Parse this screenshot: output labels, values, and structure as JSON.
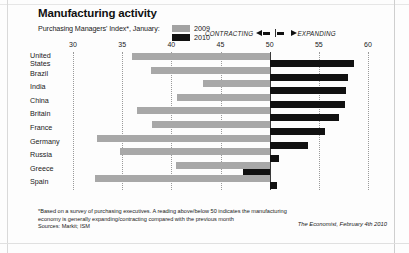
{
  "header": {
    "title": "Manufacturing activity",
    "subtitle": "Purchasing Managers' Index*, January:",
    "legend": [
      {
        "label": "2009",
        "color": "#a3a3a3"
      },
      {
        "label": "2010",
        "color": "#111111"
      }
    ],
    "banner": {
      "contracting": "CONTRACTING",
      "expanding": "EXPANDING"
    }
  },
  "footer": {
    "note_line1": "*Based on a survey of purchasing executives. A reading above/below 50 indicates the manufacturing",
    "note_line2": "economy is generally expanding/contracting compared with the previous month",
    "sources": "Sources: Markit; ISM",
    "credit": "The Economist, February 4th 2010"
  },
  "chart_data": {
    "type": "bar",
    "orientation": "horizontal",
    "title": "Manufacturing activity",
    "subtitle": "Purchasing Managers' Index*, January:",
    "xlabel": "",
    "ylabel": "",
    "xlim": [
      30,
      60
    ],
    "baseline": 50,
    "ticks": [
      30,
      35,
      40,
      45,
      50,
      55,
      60
    ],
    "grid": true,
    "legend_position": "top",
    "categories": [
      "United States",
      "Brazil",
      "India",
      "China",
      "Britain",
      "France",
      "Germany",
      "Russia",
      "Greece",
      "Spain"
    ],
    "series": [
      {
        "name": "2009",
        "color": "#a3a3a3",
        "values": [
          36.0,
          37.9,
          43.2,
          40.6,
          36.5,
          38.0,
          32.4,
          34.8,
          40.5,
          32.2
        ]
      },
      {
        "name": "2010",
        "color": "#111111",
        "values": [
          58.6,
          58.0,
          57.8,
          57.7,
          57.1,
          55.6,
          53.9,
          50.9,
          47.3,
          50.7
        ]
      }
    ]
  }
}
